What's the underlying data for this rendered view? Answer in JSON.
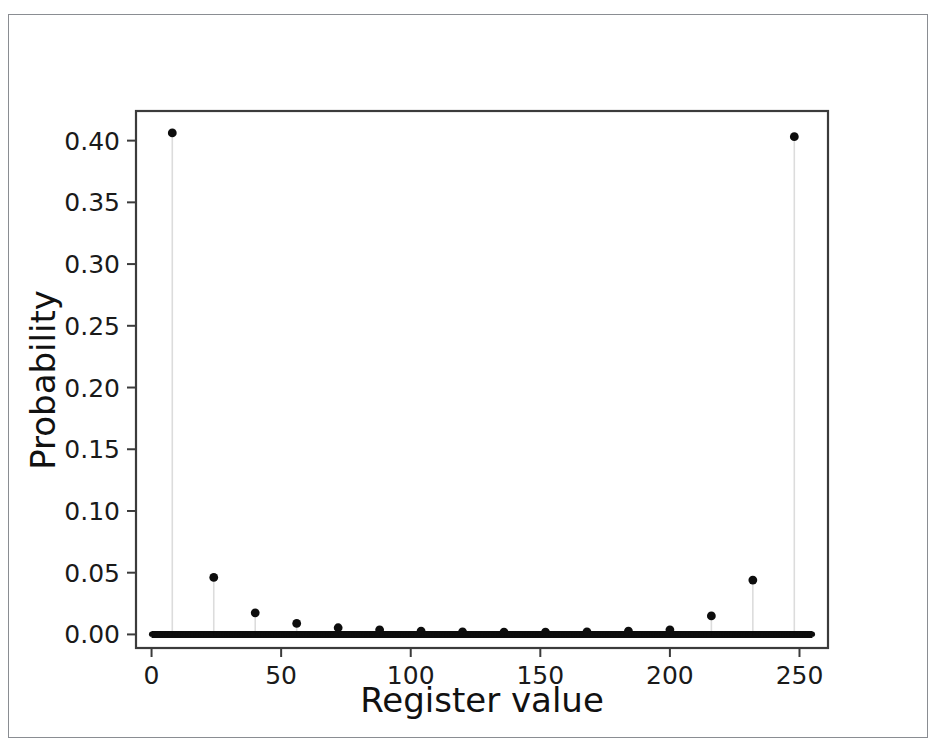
{
  "figure": {
    "background_color": "#ffffff",
    "frame_color": "#8a8d92",
    "marker_color": "#0d0d0d",
    "stem_color": "#dcdcdc",
    "axis_color": "#3b3b3b"
  },
  "chart_data": {
    "type": "line",
    "plot_style": "stem",
    "title": "",
    "xlabel": "Register value",
    "ylabel": "Probability",
    "xlim": [
      -6,
      261
    ],
    "ylim": [
      -0.011,
      0.424
    ],
    "grid": false,
    "legend": null,
    "xticks": [
      0,
      50,
      100,
      150,
      200,
      250
    ],
    "xtick_labels": [
      "0",
      "50",
      "100",
      "150",
      "200",
      "250"
    ],
    "yticks": [
      0.0,
      0.05,
      0.1,
      0.15,
      0.2,
      0.25,
      0.3,
      0.35,
      0.4
    ],
    "ytick_labels": [
      "0.00",
      "0.05",
      "0.10",
      "0.15",
      "0.20",
      "0.25",
      "0.30",
      "0.35",
      "0.40"
    ],
    "baseline": 0.0,
    "n_points": 256,
    "x_start": 0,
    "x_end": 255,
    "peaks": [
      {
        "x": 8,
        "y": 0.4062
      },
      {
        "x": 24,
        "y": 0.0462
      },
      {
        "x": 40,
        "y": 0.0175
      },
      {
        "x": 56,
        "y": 0.0089
      },
      {
        "x": 72,
        "y": 0.0054
      },
      {
        "x": 88,
        "y": 0.0037
      },
      {
        "x": 104,
        "y": 0.0027
      },
      {
        "x": 120,
        "y": 0.0021
      },
      {
        "x": 136,
        "y": 0.0019
      },
      {
        "x": 152,
        "y": 0.0019
      },
      {
        "x": 168,
        "y": 0.0021
      },
      {
        "x": 184,
        "y": 0.0027
      },
      {
        "x": 200,
        "y": 0.0037
      },
      {
        "x": 216,
        "y": 0.015
      },
      {
        "x": 232,
        "y": 0.044
      },
      {
        "x": 248,
        "y": 0.4032
      }
    ],
    "baseline_value": 0.0002
  }
}
